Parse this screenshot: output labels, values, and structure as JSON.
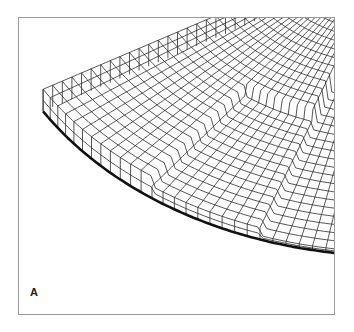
{
  "figure": {
    "panel_label": "A",
    "colors": {
      "background": "#ffffff",
      "frame": "#9a9a9a",
      "mesh_line": "#2a2a2a",
      "outer_edge": "#111111"
    }
  }
}
